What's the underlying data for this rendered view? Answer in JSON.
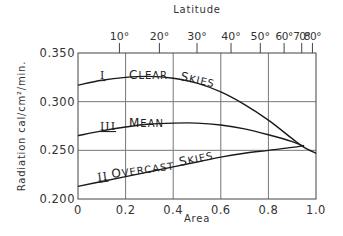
{
  "chart_data": {
    "type": "line",
    "title": "",
    "xlabel": "Area",
    "ylabel": "Radiation cal/cm²/min.",
    "top_axis_label": "Latitude",
    "xlim": [
      0,
      1.0
    ],
    "ylim": [
      0.2,
      0.35
    ],
    "x_ticks": [
      "0",
      "0.2",
      "0.4",
      "0.6",
      "0.8",
      "1.0"
    ],
    "y_ticks": [
      "0.200",
      "0.250",
      "0.300",
      "0.350"
    ],
    "top_ticks": [
      {
        "label": "10°",
        "area": 0.174
      },
      {
        "label": "20°",
        "area": 0.342
      },
      {
        "label": "30°",
        "area": 0.5
      },
      {
        "label": "40°",
        "area": 0.643
      },
      {
        "label": "50°",
        "area": 0.766
      },
      {
        "label": "60°",
        "area": 0.866
      },
      {
        "label": "70°",
        "area": 0.94
      },
      {
        "label": "80°",
        "area": 0.985
      }
    ],
    "grid": true,
    "series": [
      {
        "name": "I Clear Skies",
        "numeral": "I",
        "label": "Clear Skies",
        "x": [
          0,
          0.1,
          0.2,
          0.3,
          0.4,
          0.5,
          0.6,
          0.7,
          0.8,
          0.9,
          0.95,
          1.0
        ],
        "y": [
          0.317,
          0.322,
          0.325,
          0.326,
          0.324,
          0.319,
          0.31,
          0.297,
          0.281,
          0.262,
          0.253,
          0.247
        ]
      },
      {
        "name": "III Mean",
        "numeral": "III",
        "label": "Mean",
        "x": [
          0,
          0.1,
          0.2,
          0.3,
          0.4,
          0.5,
          0.6,
          0.7,
          0.8,
          0.9,
          0.95
        ],
        "y": [
          0.265,
          0.27,
          0.274,
          0.277,
          0.278,
          0.278,
          0.276,
          0.272,
          0.266,
          0.259,
          0.254
        ]
      },
      {
        "name": "II Overcast Skies",
        "numeral": "II",
        "label": "Overcast Skies",
        "x": [
          0,
          0.1,
          0.2,
          0.3,
          0.4,
          0.5,
          0.6,
          0.7,
          0.8,
          0.9,
          0.95
        ],
        "y": [
          0.213,
          0.218,
          0.223,
          0.228,
          0.233,
          0.238,
          0.243,
          0.247,
          0.25,
          0.253,
          0.255
        ]
      }
    ]
  }
}
